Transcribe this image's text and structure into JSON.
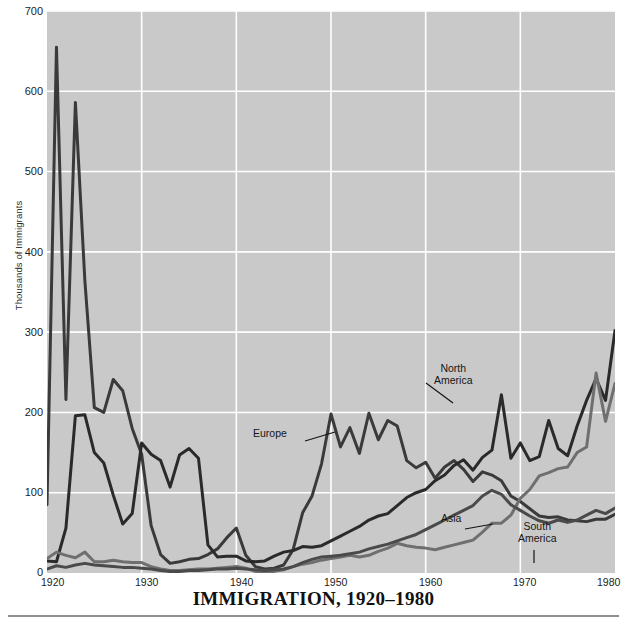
{
  "chart_data": {
    "type": "line",
    "title": "IMMIGRATION, 1920–1980",
    "xlabel": "",
    "ylabel": "Thousands of Immigrants",
    "xlim": [
      1920,
      1980
    ],
    "ylim": [
      0,
      700
    ],
    "grid": true,
    "grid_color": "#ffffff",
    "plot_background": "#c9c9c9",
    "legend": "inline-annotations",
    "xticks": [
      1920,
      1930,
      1940,
      1950,
      1960,
      1970,
      1980
    ],
    "yticks": [
      0,
      100,
      200,
      300,
      400,
      500,
      600,
      700
    ],
    "x": [
      1920,
      1921,
      1922,
      1923,
      1924,
      1925,
      1926,
      1927,
      1928,
      1929,
      1930,
      1931,
      1932,
      1933,
      1934,
      1935,
      1936,
      1937,
      1938,
      1939,
      1940,
      1941,
      1942,
      1943,
      1944,
      1945,
      1946,
      1947,
      1948,
      1949,
      1950,
      1951,
      1952,
      1953,
      1954,
      1955,
      1956,
      1957,
      1958,
      1959,
      1960,
      1961,
      1962,
      1963,
      1964,
      1965,
      1966,
      1967,
      1968,
      1969,
      1970,
      1971,
      1972,
      1973,
      1974,
      1975,
      1976,
      1977,
      1978,
      1979,
      1980
    ],
    "series": [
      {
        "name": "Europe",
        "color": "#3a3a3a",
        "linewidth": 3,
        "values": [
          85,
          655,
          216,
          586,
          364,
          206,
          200,
          241,
          227,
          180,
          148,
          59,
          23,
          12,
          14,
          17,
          18,
          23,
          30,
          44,
          56,
          22,
          8,
          5,
          6,
          10,
          29,
          75,
          96,
          136,
          198,
          157,
          181,
          149,
          199,
          166,
          190,
          183,
          140,
          131,
          138,
          118,
          132,
          140,
          129,
          114,
          126,
          122,
          115,
          96,
          89,
          80,
          71,
          69,
          70,
          66,
          65,
          64,
          67,
          67,
          73
        ]
      },
      {
        "name": "North America",
        "color": "#2a2a2a",
        "linewidth": 3,
        "values": [
          15,
          14,
          56,
          196,
          197,
          150,
          137,
          97,
          61,
          74,
          162,
          148,
          140,
          107,
          147,
          155,
          143,
          35,
          20,
          21,
          21,
          15,
          14,
          15,
          21,
          26,
          28,
          33,
          32,
          34,
          40,
          46,
          52,
          58,
          66,
          71,
          74,
          84,
          94,
          100,
          104,
          115,
          122,
          134,
          141,
          128,
          144,
          153,
          222,
          143,
          162,
          140,
          145,
          190,
          155,
          146,
          183,
          215,
          242,
          215,
          302
        ]
      },
      {
        "name": "Asia",
        "color": "#6f6f6f",
        "linewidth": 3,
        "values": [
          18,
          26,
          22,
          19,
          26,
          14,
          14,
          16,
          14,
          13,
          13,
          8,
          5,
          3,
          3,
          4,
          5,
          5,
          6,
          7,
          8,
          6,
          2,
          2,
          2,
          4,
          8,
          11,
          13,
          16,
          18,
          20,
          22,
          20,
          22,
          27,
          31,
          37,
          34,
          32,
          31,
          29,
          32,
          35,
          38,
          41,
          51,
          62,
          62,
          72,
          93,
          104,
          121,
          125,
          130,
          132,
          150,
          157,
          249,
          189,
          236
        ]
      },
      {
        "name": "South America",
        "color": "#4a4a4a",
        "linewidth": 3,
        "values": [
          5,
          9,
          7,
          10,
          12,
          10,
          9,
          8,
          7,
          7,
          6,
          5,
          3,
          2,
          2,
          3,
          3,
          4,
          5,
          5,
          6,
          5,
          4,
          3,
          4,
          5,
          8,
          13,
          17,
          20,
          21,
          22,
          24,
          26,
          30,
          33,
          36,
          40,
          44,
          48,
          54,
          60,
          66,
          72,
          78,
          84,
          96,
          103,
          98,
          85,
          78,
          71,
          65,
          62,
          66,
          63,
          66,
          72,
          78,
          74,
          81
        ]
      }
    ],
    "annotations": [
      {
        "label": "Europe",
        "lines": [
          "Europe"
        ]
      },
      {
        "label": "North America",
        "lines": [
          "North",
          "America"
        ]
      },
      {
        "label": "Asia",
        "lines": [
          "Asia"
        ]
      },
      {
        "label": "South America",
        "lines": [
          "South",
          "America"
        ]
      }
    ]
  },
  "axis": {
    "ylabel": "Thousands of Immigrants",
    "ytick_labels": [
      "700",
      "600",
      "500",
      "400",
      "300",
      "200",
      "100",
      "0"
    ],
    "xtick_labels": [
      "1920",
      "1930",
      "1940",
      "1950",
      "1960",
      "1970",
      "1980"
    ]
  },
  "annotations": {
    "europe": "Europe",
    "north_america_line1": "North",
    "north_america_line2": "America",
    "asia": "Asia",
    "south_america_line1": "South",
    "south_america_line2": "America"
  },
  "title": {
    "text": "IMMIGRATION, 1920–1980"
  }
}
